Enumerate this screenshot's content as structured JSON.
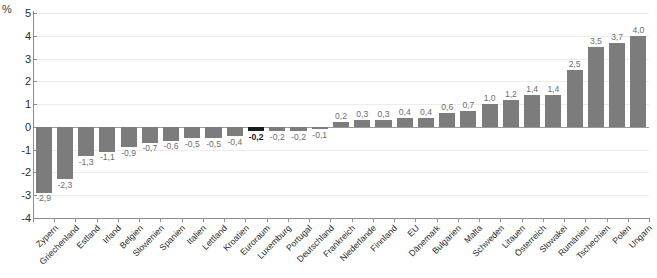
{
  "chart_data": {
    "type": "bar",
    "title": "",
    "subtitle": "",
    "xlabel": "",
    "ylabel": "%",
    "unit_label": "%",
    "ylim": [
      -4,
      5
    ],
    "ytick_values": [
      5,
      4,
      3,
      2,
      1,
      0,
      -1,
      -2,
      -3,
      -4
    ],
    "ytick_labels": [
      "5",
      "4",
      "3",
      "2",
      "1",
      "0",
      "-1",
      "-2",
      "-3",
      "-4"
    ],
    "grid": true,
    "legend": "none",
    "bar_color": "#7c7c7c",
    "highlight_color": "#1c1c1c",
    "highlight_category": "Euroraum",
    "categories": [
      "Zypern",
      "Griechenland",
      "Estland",
      "Irland",
      "Belgien",
      "Slowenien",
      "Spanien",
      "Italien",
      "Lettland",
      "Kroatien",
      "Euroraum",
      "Luxemburg",
      "Portugal",
      "Deutschland",
      "Frankreich",
      "Niederlande",
      "Finnland",
      "EU",
      "Dänemark",
      "Bulgarien",
      "Malta",
      "Schweden",
      "Litauen",
      "Österreich",
      "Slowakei",
      "Rumänien",
      "Tschechien",
      "Polen",
      "Ungarn"
    ],
    "values": [
      -2.9,
      -2.3,
      -1.3,
      -1.1,
      -0.9,
      -0.7,
      -0.6,
      -0.5,
      -0.5,
      -0.4,
      -0.2,
      -0.2,
      -0.2,
      -0.1,
      0.2,
      0.3,
      0.3,
      0.4,
      0.4,
      0.6,
      0.7,
      1.0,
      1.2,
      1.4,
      1.4,
      2.5,
      3.5,
      3.7,
      4.0
    ],
    "value_labels": [
      "-2,9",
      "-2,3",
      "-1,3",
      "-1,1",
      "-0,9",
      "-0,7",
      "-0,6",
      "-0,5",
      "-0,5",
      "-0,4",
      "-0,2",
      "-0,2",
      "-0,2",
      "-0,1",
      "0,2",
      "0,3",
      "0,3",
      "0,4",
      "0,4",
      "0,6",
      "0,7",
      "1,0",
      "1,2",
      "1,4",
      "1,4",
      "2,5",
      "3,5",
      "3,7",
      "4,0"
    ]
  }
}
